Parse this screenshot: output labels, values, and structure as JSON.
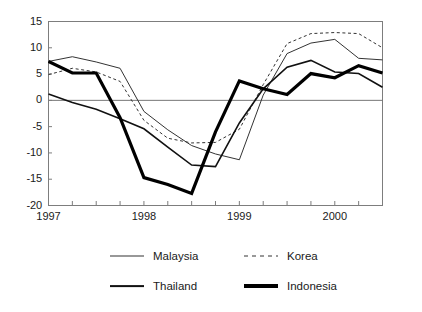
{
  "chart_data": {
    "type": "line",
    "title": "",
    "subtitle": "",
    "xlabel": "",
    "ylabel": "",
    "grid": false,
    "zero_line": true,
    "legend_position": "bottom",
    "ylim": [
      -20,
      15
    ],
    "yticks": [
      15,
      10,
      5,
      0,
      -5,
      -10,
      -15,
      -20
    ],
    "ytick_labels": [
      "15",
      "10",
      "5",
      "0",
      "-5",
      "-10",
      "-15",
      "-20"
    ],
    "x": [
      "1997Q1",
      "1997Q2",
      "1997Q3",
      "1997Q4",
      "1998Q1",
      "1998Q2",
      "1998Q3",
      "1998Q4",
      "1999Q1",
      "1999Q2",
      "1999Q3",
      "1999Q4",
      "2000Q1",
      "2000Q2",
      "2000Q3"
    ],
    "xtick_labels": [
      "1997",
      "",
      "",
      "",
      "1998",
      "",
      "",
      "",
      "1999",
      "",
      "",
      "",
      "2000",
      "",
      ""
    ],
    "xtick_major": [
      "1997",
      "1998",
      "1999",
      "2000"
    ],
    "series": [
      {
        "name": "Malaysia",
        "style": "thin-solid",
        "color": "#333333",
        "width": 1,
        "values": [
          7.4,
          8.3,
          7.3,
          6.1,
          -2.1,
          -5.6,
          -8.6,
          -10.2,
          -11.3,
          1.0,
          8.9,
          10.9,
          11.6,
          8.0,
          7.7
        ]
      },
      {
        "name": "Korea",
        "style": "dashed",
        "color": "#333333",
        "width": 1,
        "values": [
          4.9,
          6.1,
          5.4,
          3.6,
          -3.8,
          -7.2,
          -8.1,
          -8.0,
          -5.5,
          3.0,
          10.8,
          12.7,
          12.9,
          12.7,
          10.0
        ]
      },
      {
        "name": "Thailand",
        "style": "medium-solid",
        "color": "#111111",
        "width": 1.6,
        "values": [
          1.2,
          -0.4,
          -1.7,
          -3.5,
          -5.4,
          -8.9,
          -12.3,
          -12.6,
          -4.3,
          2.2,
          6.3,
          7.6,
          5.4,
          5.1,
          2.5
        ]
      },
      {
        "name": "Indonesia",
        "style": "thick-solid",
        "color": "#000000",
        "width": 3.2,
        "values": [
          7.4,
          5.2,
          5.2,
          -3.3,
          -14.7,
          -16.0,
          -17.7,
          -6.0,
          3.7,
          2.2,
          1.1,
          5.1,
          4.3,
          6.6,
          5.2
        ]
      }
    ],
    "legend": [
      {
        "label": "Malaysia",
        "style": "thin-solid"
      },
      {
        "label": "Korea",
        "style": "dashed"
      },
      {
        "label": "Thailand",
        "style": "medium-solid"
      },
      {
        "label": "Indonesia",
        "style": "thick-solid"
      }
    ]
  }
}
